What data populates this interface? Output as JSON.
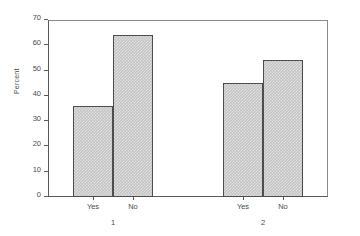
{
  "chart_data": {
    "type": "bar",
    "title": "",
    "subtitle": "",
    "xlabel": "",
    "ylabel": "Percent",
    "ylim": [
      0,
      70
    ],
    "yticks": [
      0,
      10,
      20,
      30,
      40,
      50,
      60,
      70
    ],
    "ytick_labels": [
      "0",
      "10",
      "20",
      "30",
      "40",
      "50",
      "60",
      "70"
    ],
    "grid": false,
    "legend": "none",
    "grouped": true,
    "group_labels": [
      "1",
      "2"
    ],
    "categories": [
      "Yes",
      "No"
    ],
    "groups": [
      {
        "group_label": "1",
        "bars": [
          {
            "category": "Yes",
            "value": 35.8
          },
          {
            "category": "No",
            "value": 64.2
          }
        ]
      },
      {
        "group_label": "2",
        "bars": [
          {
            "category": "Yes",
            "value": 45.2
          },
          {
            "category": "No",
            "value": 54.3
          }
        ]
      }
    ],
    "series": [
      {
        "name": "Yes",
        "values": [
          35.8,
          45.2
        ]
      },
      {
        "name": "No",
        "values": [
          64.2,
          54.3
        ]
      }
    ],
    "colors": {
      "bar_fill": "#c4c4c4",
      "bar_border": "#4d4d4d",
      "axis": "#5a5a5a",
      "frame": "#8a8a8a",
      "text": "#4a4a4a",
      "background": "#ffffff"
    }
  }
}
